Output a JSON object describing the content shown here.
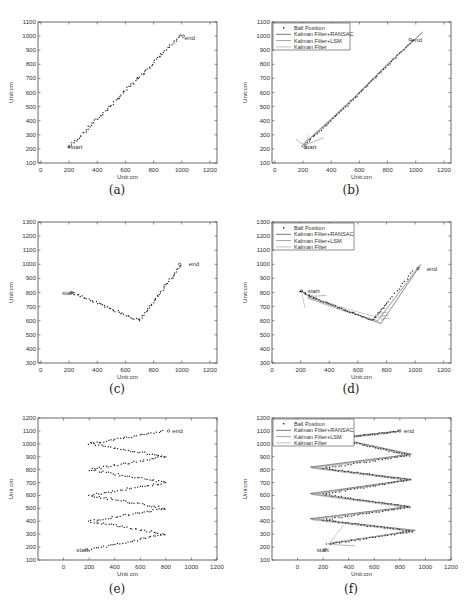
{
  "figure": {
    "legend_entries": [
      "Ball Position",
      "Kalman Filter+RANSAC",
      "Kalman Filter+LSM",
      "Kalman Filter"
    ],
    "panels": [
      {
        "id": "a",
        "caption": "(a)",
        "xlabel": "Unit:cm",
        "ylabel": "Unit:cm",
        "xlim": [
          -20,
          1250
        ],
        "ylim": [
          100,
          1100
        ],
        "xticks": [
          0,
          200,
          400,
          600,
          800,
          1000,
          1200
        ],
        "yticks": [
          100,
          200,
          300,
          400,
          500,
          600,
          700,
          800,
          900,
          1000,
          1100
        ],
        "legend": false,
        "start_label": "start",
        "end_label": "end"
      },
      {
        "id": "b",
        "caption": "(b)",
        "xlabel": "Unit:cm",
        "ylabel": "Unit:cm",
        "xlim": [
          -20,
          1250
        ],
        "ylim": [
          100,
          1100
        ],
        "xticks": [
          0,
          200,
          400,
          600,
          800,
          1000,
          1200
        ],
        "yticks": [
          100,
          200,
          300,
          400,
          500,
          600,
          700,
          800,
          900,
          1000,
          1100
        ],
        "legend": true,
        "start_label": "start",
        "end_label": "end"
      },
      {
        "id": "c",
        "caption": "(c)",
        "xlabel": "Unit:cm",
        "ylabel": "Unit:cm",
        "xlim": [
          -20,
          1250
        ],
        "ylim": [
          300,
          1300
        ],
        "xticks": [
          0,
          200,
          400,
          600,
          800,
          1000,
          1200
        ],
        "yticks": [
          300,
          400,
          500,
          600,
          700,
          800,
          900,
          1000,
          1100,
          1200,
          1300
        ],
        "legend": false,
        "start_label": "start",
        "end_label": "end"
      },
      {
        "id": "d",
        "caption": "(d)",
        "xlabel": "Unit:cm",
        "ylabel": "Unit:cm",
        "xlim": [
          0,
          1250
        ],
        "ylim": [
          300,
          1300
        ],
        "xticks": [
          0,
          200,
          400,
          600,
          800,
          1000,
          1200
        ],
        "yticks": [
          300,
          400,
          500,
          600,
          700,
          800,
          900,
          1000,
          1100,
          1200,
          1300
        ],
        "legend": true,
        "start_label": "start",
        "end_label": "end"
      },
      {
        "id": "e",
        "caption": "(e)",
        "xlabel": "Unit cm",
        "ylabel": "Unit cm",
        "xlim": [
          -200,
          1200
        ],
        "ylim": [
          100,
          1200
        ],
        "xticks": [
          0,
          200,
          400,
          600,
          800,
          1000,
          1200
        ],
        "yticks": [
          100,
          200,
          300,
          400,
          500,
          600,
          700,
          800,
          900,
          1000,
          1100,
          1200
        ],
        "legend": false,
        "start_label": "start",
        "end_label": "end"
      },
      {
        "id": "f",
        "caption": "(f)",
        "xlabel": "Unit:cm",
        "ylabel": "Unit:cm",
        "xlim": [
          -200,
          1200
        ],
        "ylim": [
          100,
          1200
        ],
        "xticks": [
          0,
          200,
          400,
          600,
          800,
          1000,
          1200
        ],
        "yticks": [
          100,
          200,
          300,
          400,
          500,
          600,
          700,
          800,
          900,
          1000,
          1100,
          1200
        ],
        "legend": true,
        "start_label": "start",
        "end_label": "end"
      }
    ]
  },
  "chart_data": [
    {
      "panel": "a",
      "type": "scatter",
      "title": "",
      "xlabel": "Unit:cm",
      "ylabel": "Unit:cm",
      "xlim": [
        -20,
        1250
      ],
      "ylim": [
        100,
        1100
      ],
      "grid": false,
      "series": [
        {
          "name": "Ball Position",
          "x": [
            200,
            300,
            400,
            500,
            600,
            700,
            800,
            900,
            1000
          ],
          "y": [
            210,
            310,
            410,
            500,
            590,
            690,
            790,
            900,
            1010
          ]
        }
      ],
      "annotations": [
        {
          "text": "start",
          "x": 210,
          "y": 210
        },
        {
          "text": "end",
          "x": 1020,
          "y": 990
        }
      ]
    },
    {
      "panel": "b",
      "type": "line",
      "title": "",
      "xlabel": "Unit:cm",
      "ylabel": "Unit:cm",
      "xlim": [
        -20,
        1250
      ],
      "ylim": [
        100,
        1100
      ],
      "grid": false,
      "legend_position": "upper left",
      "series": [
        {
          "name": "Ball Position",
          "x": [
            200,
            400,
            600,
            800,
            1000
          ],
          "y": [
            220,
            400,
            590,
            790,
            990
          ]
        },
        {
          "name": "Kalman Filter+RANSAC",
          "x": [
            200,
            400,
            600,
            800,
            1050
          ],
          "y": [
            230,
            410,
            600,
            800,
            1030
          ]
        },
        {
          "name": "Kalman Filter+LSM",
          "x": [
            200,
            400,
            600,
            800,
            1040
          ],
          "y": [
            225,
            405,
            595,
            795,
            1020
          ]
        },
        {
          "name": "Kalman Filter",
          "x": [
            200,
            400,
            600,
            800,
            1030
          ],
          "y": [
            235,
            415,
            605,
            805,
            1010
          ]
        }
      ],
      "annotations": [
        {
          "text": "start",
          "x": 210,
          "y": 210
        },
        {
          "text": "end",
          "x": 970,
          "y": 970
        }
      ]
    },
    {
      "panel": "c",
      "type": "scatter",
      "title": "",
      "xlabel": "Unit:cm",
      "ylabel": "Unit:cm",
      "xlim": [
        -20,
        1250
      ],
      "ylim": [
        300,
        1300
      ],
      "grid": false,
      "series": [
        {
          "name": "Ball Position",
          "x": [
            220,
            300,
            400,
            500,
            600,
            700,
            800,
            900,
            1000
          ],
          "y": [
            800,
            760,
            720,
            680,
            640,
            600,
            740,
            870,
            1000
          ]
        }
      ],
      "annotations": [
        {
          "text": "start",
          "x": 150,
          "y": 800
        },
        {
          "text": "end",
          "x": 1050,
          "y": 1000
        }
      ]
    },
    {
      "panel": "d",
      "type": "line",
      "title": "",
      "xlabel": "Unit:cm",
      "ylabel": "Unit:cm",
      "xlim": [
        0,
        1250
      ],
      "ylim": [
        300,
        1300
      ],
      "grid": false,
      "legend_position": "upper left",
      "series": [
        {
          "name": "Ball Position",
          "x": [
            200,
            300,
            500,
            700,
            800,
            1000
          ],
          "y": [
            810,
            760,
            680,
            600,
            720,
            970
          ]
        },
        {
          "name": "Kalman Filter+RANSAC",
          "x": [
            250,
            500,
            760,
            1040
          ],
          "y": [
            770,
            680,
            580,
            1000
          ]
        },
        {
          "name": "Kalman Filter+LSM",
          "x": [
            250,
            500,
            740,
            1030
          ],
          "y": [
            760,
            670,
            600,
            990
          ]
        },
        {
          "name": "Kalman Filter",
          "x": [
            220,
            500,
            750,
            1020
          ],
          "y": [
            790,
            690,
            620,
            980
          ]
        }
      ],
      "annotations": [
        {
          "text": "start",
          "x": 250,
          "y": 810
        },
        {
          "text": "end",
          "x": 1080,
          "y": 970
        }
      ]
    },
    {
      "panel": "e",
      "type": "scatter",
      "title": "",
      "xlabel": "Unit cm",
      "ylabel": "Unit cm",
      "xlim": [
        -200,
        1200
      ],
      "ylim": [
        100,
        1200
      ],
      "grid": false,
      "series": [
        {
          "name": "Ball Position",
          "x": [
            200,
            800,
            200,
            800,
            200,
            800,
            200,
            800,
            200,
            800,
            200,
            800
          ],
          "y": [
            180,
            300,
            400,
            500,
            600,
            700,
            800,
            900,
            1000,
            1100,
            1000,
            1100
          ]
        }
      ],
      "path_vertices": [
        [
          200,
          180
        ],
        [
          800,
          300
        ],
        [
          200,
          400
        ],
        [
          800,
          500
        ],
        [
          200,
          600
        ],
        [
          800,
          700
        ],
        [
          200,
          800
        ],
        [
          800,
          900
        ],
        [
          200,
          1000
        ],
        [
          800,
          1100
        ]
      ],
      "annotations": [
        {
          "text": "start",
          "x": 100,
          "y": 180
        },
        {
          "text": "end",
          "x": 850,
          "y": 1100
        }
      ]
    },
    {
      "panel": "f",
      "type": "line",
      "title": "",
      "xlabel": "Unit:cm",
      "ylabel": "Unit:cm",
      "xlim": [
        -200,
        1200
      ],
      "ylim": [
        100,
        1200
      ],
      "grid": false,
      "legend_position": "upper left",
      "series": [
        {
          "name": "Ball Position",
          "vertices": [
            [
              230,
              220
            ],
            [
              900,
              320
            ],
            [
              200,
              410
            ],
            [
              880,
              510
            ],
            [
              200,
              610
            ],
            [
              880,
              720
            ],
            [
              200,
              810
            ],
            [
              880,
              910
            ],
            [
              300,
              1040
            ],
            [
              800,
              1100
            ]
          ]
        },
        {
          "name": "Kalman Filter+RANSAC",
          "vertices": [
            [
              240,
              225
            ],
            [
              920,
              330
            ],
            [
              100,
              420
            ],
            [
              880,
              515
            ],
            [
              100,
              615
            ],
            [
              890,
              725
            ],
            [
              100,
              820
            ],
            [
              890,
              920
            ],
            [
              300,
              1045
            ],
            [
              800,
              1100
            ]
          ]
        },
        {
          "name": "Kalman Filter+LSM",
          "vertices": [
            [
              250,
              230
            ],
            [
              910,
              325
            ],
            [
              110,
              415
            ],
            [
              870,
              510
            ],
            [
              110,
              610
            ],
            [
              880,
              720
            ],
            [
              110,
              815
            ],
            [
              880,
              915
            ],
            [
              310,
              1040
            ],
            [
              790,
              1095
            ]
          ]
        },
        {
          "name": "Kalman Filter",
          "vertices": [
            [
              260,
              235
            ],
            [
              900,
              320
            ],
            [
              120,
              410
            ],
            [
              860,
              505
            ],
            [
              120,
              605
            ],
            [
              870,
              715
            ],
            [
              120,
              810
            ],
            [
              870,
              910
            ],
            [
              320,
              1035
            ],
            [
              780,
              1090
            ]
          ]
        }
      ],
      "annotations": [
        {
          "text": "start",
          "x": 150,
          "y": 180
        },
        {
          "text": "end",
          "x": 830,
          "y": 1100
        }
      ]
    }
  ]
}
